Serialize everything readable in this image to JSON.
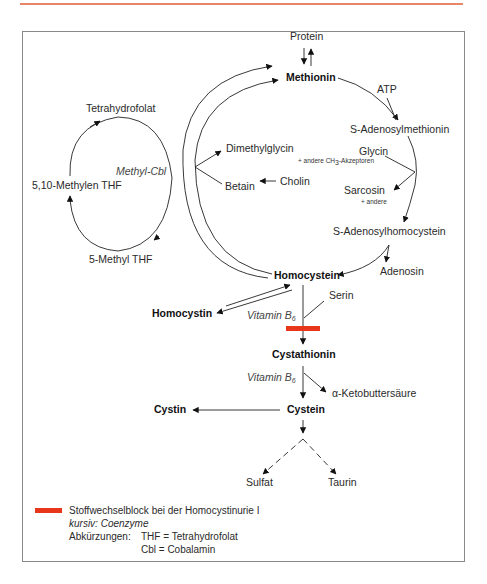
{
  "header_rule": {
    "color": "#e9866a"
  },
  "diagram": {
    "nodes": {
      "protein": "Protein",
      "methionin": "Methionin",
      "atp": "ATP",
      "s_adenosylmethionin": "S-Adenosylmethionin",
      "glycin": "Glycin",
      "glycin_note": "+ andere CH",
      "glycin_note_sub": "3",
      "glycin_note_tail": "-Akzeptoren",
      "sarcosin": "Sarcosin",
      "sarcosin_note": "+ andere",
      "s_adenosylhomocystein": "S-Adenosylhomocystein",
      "adenosin": "Adenosin",
      "homocystein": "Homocystein",
      "homocystin": "Homocystin",
      "serin": "Serin",
      "vitamin_b6_1": "Vitamin B",
      "vitamin_b6_1_sub": "6",
      "cystathionin": "Cystathionin",
      "vitamin_b6_2": "Vitamin B",
      "vitamin_b6_2_sub": "6",
      "alpha_ketobuttersaeure": "α-Ketobuttersäure",
      "cystein": "Cystein",
      "cystin": "Cystin",
      "sulfat": "Sulfat",
      "taurin": "Taurin",
      "dimethylglycin": "Dimethylglycin",
      "betain": "Betain",
      "cholin": "Cholin",
      "tetrahydrofolat": "Tetrahydrofolat",
      "methylen_thf": "5,10-Methylen THF",
      "methyl_thf": "5-Methyl THF",
      "methyl_cbl": "Methyl-Cbl"
    },
    "block_color": "#e8361a"
  },
  "legend": {
    "block_label": "Stoffwechselblock bei der Homocystinurie I",
    "italic_note": "kursiv: Coenzyme",
    "abbrev_title": "Abkürzungen:",
    "abbrev_1": "THF = Tetrahydrofolat",
    "abbrev_2": "Cbl = Cobalamin"
  }
}
